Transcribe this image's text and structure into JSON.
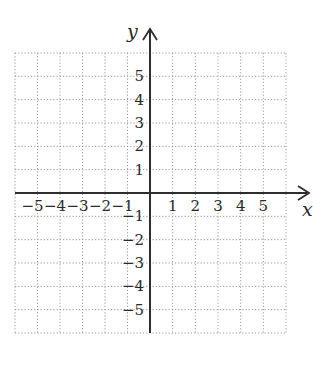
{
  "chart_data": {
    "type": "coordinate-grid",
    "title": "",
    "xlabel": "x",
    "ylabel": "y",
    "xlim": [
      -6,
      6
    ],
    "ylim": [
      -6,
      6
    ],
    "grid": true,
    "grid_style": "dotted",
    "x_ticks": [
      -5,
      -4,
      -3,
      -2,
      -1,
      1,
      2,
      3,
      4,
      5
    ],
    "y_ticks": [
      5,
      4,
      3,
      2,
      1,
      -1,
      -2,
      -3,
      -4,
      -5
    ],
    "x_tick_labels": [
      "−5",
      "−4",
      "−3",
      "−2",
      "−1",
      "1",
      "2",
      "3",
      "4",
      "5"
    ],
    "y_tick_labels": [
      "5",
      "4",
      "3",
      "2",
      "1",
      "−1",
      "−2",
      "−3",
      "−4",
      "−5"
    ],
    "series": [],
    "legend": null
  },
  "colors": {
    "axis": "#2e2e2e",
    "grid": "#9a9a9a",
    "text": "#2a2a2a",
    "background": "#ffffff"
  }
}
